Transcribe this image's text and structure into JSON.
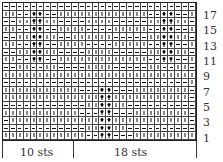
{
  "chart": {
    "columns": 28,
    "rows_count": 18,
    "legend": {
      "K": "knit",
      "P": "purl",
      "C": "cable"
    },
    "rows": [
      "PPPPPPPPPPPPPPPPPPPPPPPPPPPP",
      "KKPPCCPPKKKKKKKKKKKKKPPCCPPK",
      "PPKKCCKKPPPPKKKKPPPPPKKCCKKP",
      "KKPPCCPPKKKKPPPPKKKKKPPCCPPK",
      "PPKKCCKKPPKKKKKKPPPPPKKCCKKP",
      "KKPPCCPPKKKKPPPPKKKKKPPCCPPK",
      "PPKKCCKKPPPPKKKKPPPPPKKCCKKP",
      "KKPPCCPPKKKKKKKKKKKKKPPCCPPK",
      "PPKKPPKKPPPPKKKKPPPPPKKPPKKP",
      "KKKKKKKKKKKKKKKKKKKKKKKKKKKK",
      "PPPPPPPPPPPPPPPPPPPPPPPPPPPK",
      "KKKKKKKKKKKPPPCCPPPKKKKKKKKP",
      "KKKKKKKKKKKKKKCCKKKKKKKKKKKP",
      "PPPPPPPPPPPPKKCCKKPPPPPPPPPP",
      "KKKKKKKKKKKPPPCCPPPKKKKKKKKP",
      "PKKKKKKKKKKKKKCCKKKKKKKKKKKP",
      "PPPPPPPPPPPPKKCCKKPPPPPPPPPP",
      "KKKKKKKKKKKKPPCCPPPKKKKKKKKK"
    ],
    "row_labels": [
      {
        "label": "17",
        "top": 10
      },
      {
        "label": "15",
        "top": 25
      },
      {
        "label": "13",
        "top": 41
      },
      {
        "label": "11",
        "top": 56
      },
      {
        "label": "9",
        "top": 71
      },
      {
        "label": "7",
        "top": 87
      },
      {
        "label": "5",
        "top": 102
      },
      {
        "label": "3",
        "top": 117
      },
      {
        "label": "1",
        "top": 133
      }
    ],
    "repeat_labels": {
      "left": "10 sts",
      "right": "18 sts"
    }
  }
}
